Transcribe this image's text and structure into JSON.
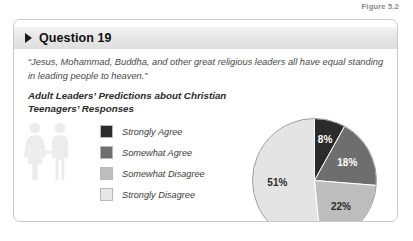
{
  "figure": {
    "caption": "Figure 5.2"
  },
  "panel": {
    "header": {
      "arrow_icon": "triangle-right-icon",
      "title": "Question 19"
    },
    "quote": "“Jesus, Mohammad, Buddha, and other great religious leaders all have equal standing in leading people to heaven.”",
    "chart_title": "Adult Leaders’ Predictions about Christian Teenagers’ Responses",
    "decoration": {
      "icon": "two-people-icon",
      "color": "#eceded"
    }
  },
  "chart_data": {
    "type": "pie",
    "title": "Adult Leaders’ Predictions about Christian Teenagers’ Responses",
    "categories": [
      "Strongly Agree",
      "Somewhat Agree",
      "Somewhat Disagree",
      "Strongly Disagree"
    ],
    "values": [
      8,
      18,
      22,
      51
    ],
    "value_labels": [
      "8%",
      "18%",
      "22%",
      "51%"
    ],
    "colors": [
      "#2b2b2b",
      "#6e6e6e",
      "#bdbdbd",
      "#e4e4e4"
    ],
    "label_text_colors": [
      "#ffffff",
      "#ffffff",
      "#2b2b2b",
      "#2b2b2b"
    ],
    "legend_position": "left",
    "start_angle_deg": 0,
    "direction": "clockwise",
    "units": "percent",
    "grid": false
  }
}
